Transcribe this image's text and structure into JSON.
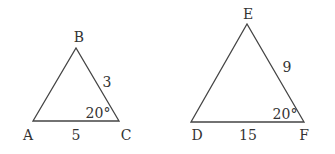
{
  "diagram": {
    "triangles": [
      {
        "vertices": {
          "top": "B",
          "left": "A",
          "right": "C"
        },
        "side_right": "3",
        "side_bottom": "5",
        "angle_right": "20°"
      },
      {
        "vertices": {
          "top": "E",
          "left": "D",
          "right": "F"
        },
        "side_right": "9",
        "side_bottom": "15",
        "angle_right": "20°"
      }
    ]
  }
}
